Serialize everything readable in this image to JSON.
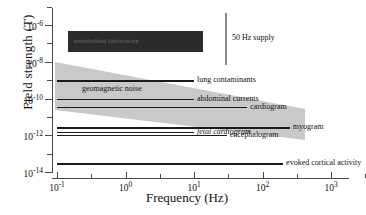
{
  "chart_data": {
    "type": "line",
    "title": "",
    "xlabel": "Frequency (Hz)",
    "ylabel": "Field strength (T)",
    "xscale": "log",
    "yscale": "log",
    "xlim": [
      0.05,
      5000
    ],
    "ylim": [
      1e-15,
      5e-06
    ],
    "grid": false,
    "legend": "none",
    "xticks": [
      {
        "value": 0.1,
        "label": "10",
        "exp": "-1"
      },
      {
        "value": 1,
        "label": "10",
        "exp": "0"
      },
      {
        "value": 10,
        "label": "10",
        "exp": "1"
      },
      {
        "value": 100,
        "label": "10",
        "exp": "2"
      },
      {
        "value": 1000,
        "label": "10",
        "exp": "3"
      }
    ],
    "yticks": [
      {
        "value": 1e-06,
        "label": "10",
        "exp": "-6"
      },
      {
        "value": 1e-08,
        "label": "10",
        "exp": "-8"
      },
      {
        "value": 1e-10,
        "label": "10",
        "exp": "-10"
      },
      {
        "value": 1e-12,
        "label": "10",
        "exp": "-12"
      },
      {
        "value": 1e-14,
        "label": "10",
        "exp": "-14"
      }
    ],
    "regions": [
      {
        "name": "unshielded-laboratory",
        "label": "unshielded laboratory",
        "shape": "rect",
        "color": "#2b2b2b",
        "x_range": [
          0.12,
          20
        ],
        "y_range": [
          7e-08,
          3e-06
        ]
      },
      {
        "name": "geomagnetic-noise",
        "label": "geomagnetic noise",
        "shape": "wedge",
        "color": "#c9c9c9",
        "x_range": [
          0.1,
          1000
        ],
        "y_start_range": [
          2e-11,
          8e-09
        ],
        "y_end_range": [
          8e-13,
          3e-11
        ]
      },
      {
        "name": "50-hz-supply",
        "label": "50 Hz supply",
        "shape": "vline",
        "color": "#8a8a8a",
        "x_value": 50,
        "y_range": [
          8e-09,
          2e-06
        ]
      }
    ],
    "signals": [
      {
        "name": "lung-contaminants",
        "label": "lung contaminants",
        "y": 1e-09,
        "x_start": 0.1,
        "x_end": 10,
        "italic": false
      },
      {
        "name": "abdominal-currents",
        "label": "abdominal currents",
        "y": 1e-10,
        "x_start": 0.1,
        "x_end": 10,
        "italic": false
      },
      {
        "name": "cardiogram",
        "label": "cardiogram",
        "y": 3.5e-11,
        "x_start": 0.1,
        "x_end": 60,
        "italic": false
      },
      {
        "name": "myogram",
        "label": "myogram",
        "y": 2.8e-12,
        "x_start": 0.1,
        "x_end": 250,
        "italic": false
      },
      {
        "name": "fetal-cardiogram",
        "label": "fetal cardiogram",
        "y": 1.6e-12,
        "x_start": 0.1,
        "x_end": 10,
        "italic": true
      },
      {
        "name": "encephalogram",
        "label": "encephalogram",
        "y": 1.1e-12,
        "x_start": 0.1,
        "x_end": 30,
        "italic": false
      },
      {
        "name": "evoked-cortical-activity",
        "label": "evoked cortical activity",
        "y": 3e-14,
        "x_start": 0.1,
        "x_end": 200,
        "italic": false
      }
    ]
  },
  "axes": {
    "x_title": "Frequency (Hz)",
    "y_title": "Field strength (T)"
  }
}
